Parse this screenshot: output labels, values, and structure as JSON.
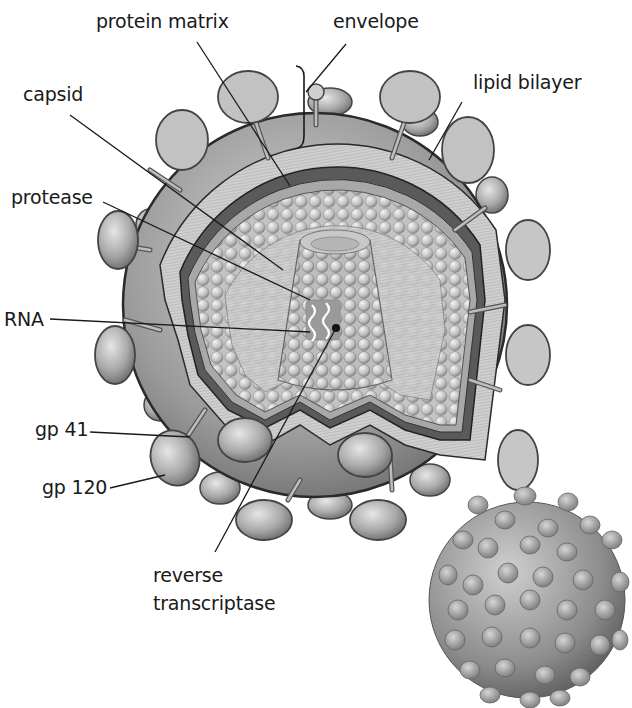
{
  "diagram": {
    "colors": {
      "background": "#ffffff",
      "outline": "#2a2a2a",
      "envelope_fill": "#9a9a9a",
      "bilayer_fill": "#d4d4d4",
      "matrix_fill": "#c8c8c8",
      "knob_fill": "#b0b0b0",
      "label": "#1a1a1a"
    },
    "labels": {
      "protein_matrix": "protein matrix",
      "envelope": "envelope",
      "capsid": "capsid",
      "lipid_bilayer": "lipid bilayer",
      "protease": "protease",
      "rna": "RNA",
      "gp41": "gp 41",
      "gp120": "gp 120",
      "reverse_transcriptase_line1": "reverse",
      "reverse_transcriptase_line2": "transcriptase"
    }
  }
}
